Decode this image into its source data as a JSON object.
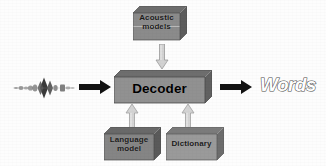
{
  "diagram": {
    "background_color": "#fdfdfd",
    "blocks": [
      {
        "id": "acoustic",
        "label": "Acoustic\nmodels",
        "line1": "Acoustic",
        "line2": "models",
        "face_color": "#8a8a8a",
        "top_color": "#6f6f6f",
        "side_color": "#5f5f5f"
      },
      {
        "id": "decoder",
        "label": "Decoder",
        "face_color": "#8f8f8f",
        "top_color": "#6e6e6e",
        "side_color": "#636363"
      },
      {
        "id": "language",
        "label": "Language\nmodel",
        "line1": "Language",
        "line2": "model",
        "face_color": "#848484",
        "top_color": "#6a6a6a",
        "side_color": "#5c5c5c"
      },
      {
        "id": "dictionary",
        "label": "Dictionary",
        "face_color": "#999999",
        "top_color": "#7b7b7b",
        "side_color": "#6d6d6d"
      }
    ],
    "input": {
      "waveform_name": "speech-waveform",
      "arrow_color": "#121212"
    },
    "output": {
      "text": "Words",
      "style": "wordart-italic-outline",
      "fill_color": "#ffffff",
      "outline_color": "#4a4a4a",
      "arrow_color": "#121212"
    },
    "connectors": [
      {
        "id": "acoustic-to-decoder",
        "direction": "down",
        "color": "#c6c6c6",
        "edge_color": "#8e8e8e"
      },
      {
        "id": "language-to-decoder",
        "direction": "up",
        "color": "#cfcfcf",
        "edge_color": "#9a9a9a"
      },
      {
        "id": "dictionary-to-decoder",
        "direction": "up",
        "color": "#cfcfcf",
        "edge_color": "#9a9a9a"
      }
    ]
  }
}
